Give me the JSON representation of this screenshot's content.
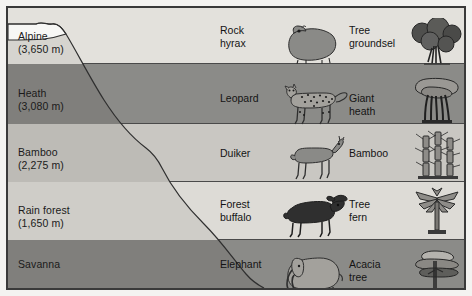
{
  "diagram": {
    "type": "cross-section",
    "colors": {
      "frame_border": "#3a3a3a",
      "page_background": "#f2f1ef",
      "panel_background": "#eceae6",
      "band_light": "#e3e1dc",
      "band_medium_light": "#c9c7c2",
      "band_dark": "#8b8b88",
      "mountain_light": "#d6d4cf",
      "mountain_medium": "#bdbbb6",
      "mountain_dark": "#807f7c",
      "snow": "#f7f7f5",
      "text": "#1a1a1a",
      "art_dark": "#3b3b3b",
      "art_mid": "#8a8a87",
      "art_light": "#b8b6b1"
    },
    "columns": [
      {
        "key": "zone",
        "name": "vegetation-zone"
      },
      {
        "key": "animal",
        "name": "characteristic-animal"
      },
      {
        "key": "plant",
        "name": "characteristic-plant"
      }
    ],
    "rows": [
      {
        "zone": "Alpine\n(3,650 m)",
        "zone_name": "Alpine",
        "altitude": "3,650 m",
        "animal": "Rock\nhyrax",
        "animal_name": "Rock hyrax",
        "plant": "Tree\ngroundsel",
        "plant_name": "Tree groundsel",
        "band_color": "#e3e1dc",
        "slope_color": "#d6d4cf"
      },
      {
        "zone": "Heath\n(3,080 m)",
        "zone_name": "Heath",
        "altitude": "3,080 m",
        "animal": "Leopard",
        "animal_name": "Leopard",
        "plant": "Giant\nheath",
        "plant_name": "Giant heath",
        "band_color": "#8b8b88",
        "slope_color": "#807f7c"
      },
      {
        "zone": "Bamboo\n(2,275 m)",
        "zone_name": "Bamboo",
        "altitude": "2,275 m",
        "animal": "Duiker",
        "animal_name": "Duiker",
        "plant": "Bamboo",
        "plant_name": "Bamboo",
        "band_color": "#c9c7c2",
        "slope_color": "#bdbbb6"
      },
      {
        "zone": "Rain forest\n(1,650 m)",
        "zone_name": "Rain forest",
        "altitude": "1,650 m",
        "animal": "Forest\nbuffalo",
        "animal_name": "Forest buffalo",
        "plant": "Tree\nfern",
        "plant_name": "Tree fern",
        "band_color": "#dddbd6",
        "slope_color": "#cfcdc8"
      },
      {
        "zone": "Savanna",
        "zone_name": "Savanna",
        "altitude": "",
        "animal": "Elephant",
        "animal_name": "Elephant",
        "plant": "Acacia\ntree",
        "plant_name": "Acacia tree",
        "band_color": "#8b8b88",
        "slope_color": "#807f7c"
      }
    ],
    "summit": {
      "feature": "snow-cap",
      "label": ""
    }
  }
}
